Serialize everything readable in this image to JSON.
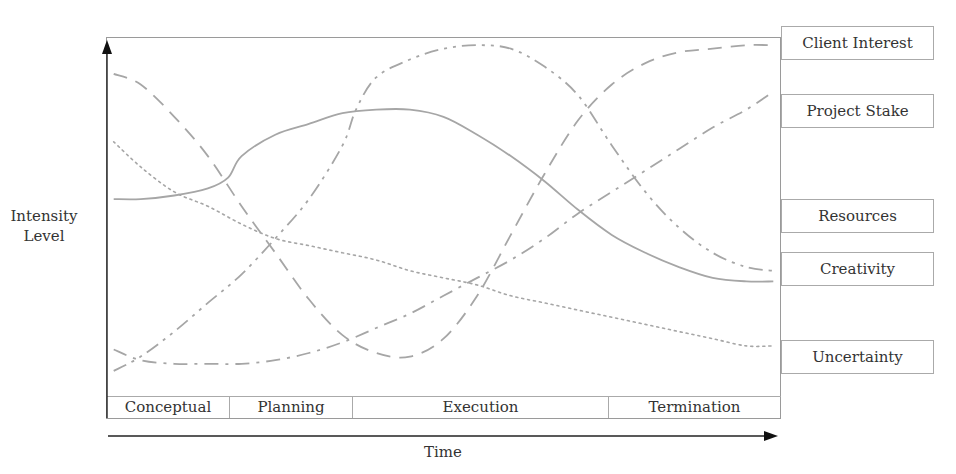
{
  "chart_data": {
    "type": "line",
    "title": "",
    "xlabel": "Time",
    "ylabel": "Intensity Level",
    "grid": false,
    "legend_position": "right",
    "x_range": [
      0,
      100
    ],
    "y_range": [
      0,
      100
    ],
    "phases": [
      "Conceptual",
      "Planning",
      "Execution",
      "Termination"
    ],
    "phase_bounds": [
      0,
      18,
      37,
      75,
      100
    ],
    "series": [
      {
        "name": "Client Interest",
        "style": "long-dash",
        "x": [
          1,
          5,
          10,
          15,
          20,
          25,
          30,
          35,
          40,
          45,
          50,
          55,
          60,
          65,
          70,
          75,
          80,
          85,
          90,
          95,
          99
        ],
        "values": [
          90,
          87,
          78,
          67,
          53,
          40,
          27,
          17,
          12,
          11,
          16,
          28,
          45,
          62,
          77,
          87,
          93,
          96,
          97,
          98,
          98
        ]
      },
      {
        "name": "Project Stake",
        "style": "dash-dot",
        "x": [
          1,
          5,
          10,
          15,
          20,
          25,
          30,
          35,
          40,
          45,
          50,
          55,
          60,
          65,
          70,
          75,
          80,
          85,
          90,
          95,
          99
        ],
        "values": [
          13,
          10,
          9,
          9,
          9,
          10,
          12,
          15,
          19,
          23,
          28,
          33,
          38,
          44,
          51,
          57,
          63,
          69,
          75,
          80,
          85
        ]
      },
      {
        "name": "Resources",
        "style": "dash-dot-dot",
        "x": [
          1,
          5,
          10,
          15,
          20,
          25,
          30,
          35,
          37,
          40,
          45,
          50,
          55,
          60,
          65,
          70,
          75,
          80,
          85,
          90,
          95,
          99
        ],
        "values": [
          7,
          11,
          18,
          26,
          34,
          44,
          55,
          70,
          80,
          89,
          94,
          97,
          98,
          97,
          92,
          84,
          70,
          57,
          47,
          40,
          36,
          35
        ]
      },
      {
        "name": "Creativity",
        "style": "solid",
        "x": [
          1,
          5,
          10,
          15,
          18,
          20,
          25,
          30,
          35,
          40,
          45,
          50,
          55,
          60,
          65,
          70,
          75,
          80,
          85,
          90,
          95,
          99
        ],
        "values": [
          55,
          55,
          56,
          58,
          61,
          67,
          73,
          76,
          79,
          80,
          80,
          78,
          73,
          67,
          60,
          52,
          45,
          40,
          36,
          33,
          32,
          32
        ]
      },
      {
        "name": "Uncertainty",
        "style": "dotted",
        "x": [
          1,
          5,
          10,
          15,
          20,
          25,
          30,
          35,
          40,
          45,
          50,
          55,
          60,
          65,
          70,
          75,
          80,
          85,
          90,
          95,
          99
        ],
        "values": [
          71,
          64,
          57,
          53,
          48,
          44,
          42,
          40,
          38,
          35,
          33,
          31,
          28,
          26,
          24,
          22,
          20,
          18,
          16,
          14,
          14
        ]
      }
    ]
  },
  "legend": {
    "items": [
      {
        "label": "Client Interest"
      },
      {
        "label": "Project Stake"
      },
      {
        "label": "Resources"
      },
      {
        "label": "Creativity"
      },
      {
        "label": "Uncertainty"
      }
    ]
  },
  "axes": {
    "ylabel_line1": "Intensity",
    "ylabel_line2": "Level",
    "xlabel": "Time"
  },
  "colors": {
    "curve": "#a6a6a6",
    "axis": "#222222",
    "frame": "#9a9a9a"
  }
}
